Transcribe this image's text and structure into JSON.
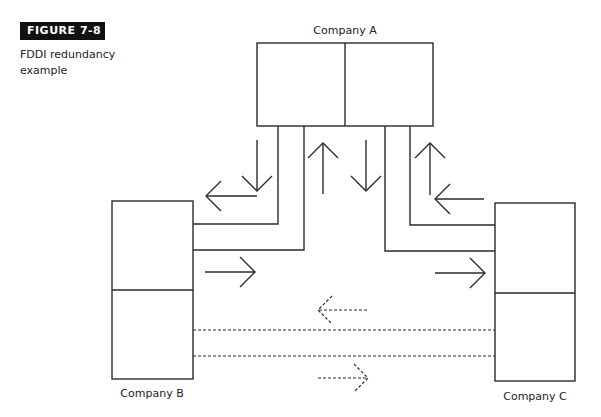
{
  "figure": {
    "badge": "FIGURE 7-8",
    "caption_line1": "FDDI redundancy",
    "caption_line2": "example"
  },
  "nodes": {
    "a": {
      "label": "Company A"
    },
    "b": {
      "label": "Company B"
    },
    "c": {
      "label": "Company C"
    }
  },
  "colors": {
    "stroke": "#2a2a2a",
    "badge_bg": "#111111",
    "badge_text": "#ffffff"
  },
  "links": [
    {
      "from": "Company A",
      "to": "Company B",
      "type": "solid",
      "description": "dual ring pair (primary)"
    },
    {
      "from": "Company A",
      "to": "Company C",
      "type": "solid",
      "description": "dual ring pair (primary)"
    },
    {
      "from": "Company B",
      "to": "Company C",
      "type": "dashed",
      "description": "redundant backup pair"
    }
  ]
}
